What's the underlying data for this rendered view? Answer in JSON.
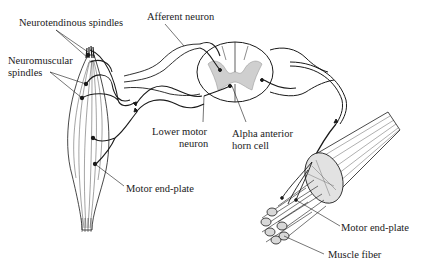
{
  "diagram": {
    "type": "anatomical-illustration",
    "colors": {
      "ink": "#1a1a1a",
      "background": "#ffffff",
      "stipple": "#9a9a9a"
    },
    "labels": {
      "neurotendinous_spindles": "Neurotendinous spindles",
      "afferent_neuron": "Afferent neuron",
      "neuromuscular_spindles_line1": "Neuromuscular",
      "neuromuscular_spindles_line2": "spindles",
      "lower_motor_neuron_line1": "Lower motor",
      "lower_motor_neuron_line2": "neuron",
      "alpha_anterior_horn_cell_line1": "Alpha anterior",
      "alpha_anterior_horn_cell_line2": "horn cell",
      "motor_end_plate_left": "Motor end-plate",
      "motor_end_plate_right": "Motor end-plate",
      "muscle_fiber": "Muscle fiber"
    },
    "components": [
      "whole-muscle",
      "spinal-cord-cross-section",
      "afferent-nerve-fiber",
      "efferent-nerve-fiber",
      "muscle-fiber-bundle"
    ]
  }
}
